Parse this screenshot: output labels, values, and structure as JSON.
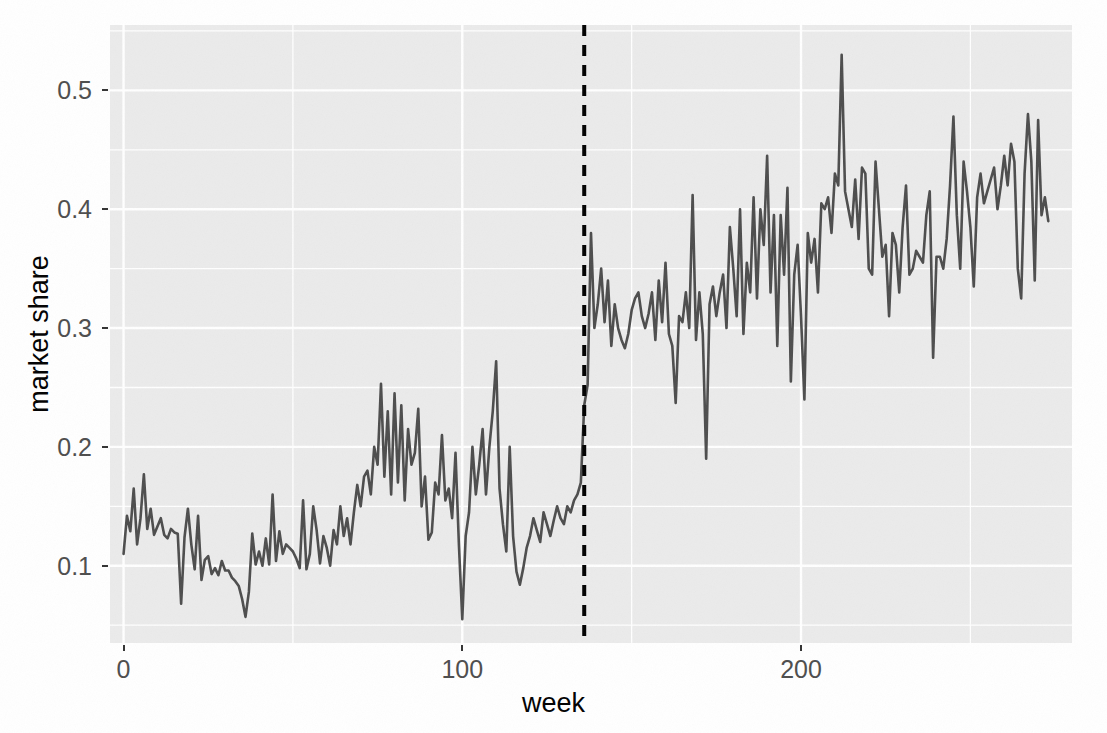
{
  "chart_data": {
    "type": "line",
    "title": "",
    "subtitle": "",
    "xlabel": "week",
    "ylabel": "market share",
    "xlim": [
      -4,
      280
    ],
    "ylim": [
      0.035,
      0.555
    ],
    "grid": true,
    "grid_major": true,
    "grid_minor": true,
    "legend": "none",
    "line_color": "#4d4d4d",
    "panel_color": "#ebebeb",
    "grid_color": "#ffffff",
    "xticks": [
      0,
      100,
      200
    ],
    "xtick_labels": [
      "0",
      "100",
      "200"
    ],
    "yticks": [
      0.1,
      0.2,
      0.3,
      0.4,
      0.5
    ],
    "ytick_labels": [
      "0.1",
      "0.2",
      "0.3",
      "0.4",
      "0.5"
    ],
    "annotations": [
      {
        "name": "intervention-line",
        "type": "vline",
        "x": 136,
        "style": "dashed",
        "color": "#000000",
        "linewidth": 3
      }
    ],
    "series": [
      {
        "name": "market share",
        "x_start": 0,
        "x_step": 1,
        "values": [
          0.11,
          0.142,
          0.129,
          0.165,
          0.118,
          0.14,
          0.177,
          0.131,
          0.148,
          0.126,
          0.133,
          0.14,
          0.126,
          0.123,
          0.131,
          0.128,
          0.127,
          0.068,
          0.124,
          0.148,
          0.118,
          0.097,
          0.142,
          0.088,
          0.105,
          0.108,
          0.093,
          0.098,
          0.092,
          0.104,
          0.096,
          0.096,
          0.09,
          0.087,
          0.083,
          0.072,
          0.057,
          0.078,
          0.127,
          0.101,
          0.112,
          0.1,
          0.123,
          0.101,
          0.16,
          0.104,
          0.129,
          0.11,
          0.118,
          0.115,
          0.112,
          0.106,
          0.098,
          0.155,
          0.097,
          0.11,
          0.15,
          0.13,
          0.102,
          0.125,
          0.115,
          0.1,
          0.13,
          0.118,
          0.15,
          0.125,
          0.14,
          0.118,
          0.145,
          0.168,
          0.15,
          0.175,
          0.18,
          0.16,
          0.2,
          0.185,
          0.253,
          0.175,
          0.23,
          0.16,
          0.245,
          0.17,
          0.235,
          0.155,
          0.215,
          0.185,
          0.195,
          0.232,
          0.15,
          0.175,
          0.122,
          0.128,
          0.17,
          0.16,
          0.21,
          0.155,
          0.165,
          0.14,
          0.195,
          0.118,
          0.055,
          0.125,
          0.145,
          0.2,
          0.16,
          0.185,
          0.215,
          0.16,
          0.2,
          0.23,
          0.272,
          0.165,
          0.135,
          0.112,
          0.2,
          0.125,
          0.095,
          0.084,
          0.098,
          0.115,
          0.125,
          0.14,
          0.13,
          0.12,
          0.145,
          0.135,
          0.125,
          0.138,
          0.15,
          0.14,
          0.135,
          0.15,
          0.145,
          0.155,
          0.16,
          0.17,
          0.235,
          0.252,
          0.38,
          0.3,
          0.32,
          0.35,
          0.305,
          0.34,
          0.285,
          0.32,
          0.3,
          0.29,
          0.283,
          0.295,
          0.315,
          0.325,
          0.33,
          0.31,
          0.3,
          0.312,
          0.33,
          0.29,
          0.34,
          0.305,
          0.355,
          0.295,
          0.285,
          0.237,
          0.31,
          0.305,
          0.33,
          0.3,
          0.412,
          0.29,
          0.33,
          0.295,
          0.19,
          0.32,
          0.335,
          0.31,
          0.33,
          0.345,
          0.3,
          0.385,
          0.35,
          0.31,
          0.4,
          0.295,
          0.355,
          0.33,
          0.41,
          0.325,
          0.4,
          0.37,
          0.445,
          0.33,
          0.395,
          0.285,
          0.395,
          0.345,
          0.418,
          0.255,
          0.345,
          0.37,
          0.31,
          0.24,
          0.38,
          0.355,
          0.375,
          0.33,
          0.405,
          0.4,
          0.41,
          0.38,
          0.43,
          0.42,
          0.53,
          0.415,
          0.4,
          0.385,
          0.425,
          0.375,
          0.435,
          0.43,
          0.35,
          0.345,
          0.44,
          0.4,
          0.36,
          0.37,
          0.31,
          0.38,
          0.37,
          0.33,
          0.385,
          0.42,
          0.345,
          0.35,
          0.365,
          0.36,
          0.355,
          0.395,
          0.415,
          0.275,
          0.36,
          0.36,
          0.35,
          0.375,
          0.42,
          0.478,
          0.395,
          0.35,
          0.44,
          0.415,
          0.385,
          0.335,
          0.41,
          0.43,
          0.405,
          0.415,
          0.425,
          0.435,
          0.4,
          0.42,
          0.445,
          0.42,
          0.455,
          0.44,
          0.35,
          0.325,
          0.43,
          0.48,
          0.44,
          0.34,
          0.475,
          0.395,
          0.41,
          0.39
        ]
      }
    ]
  },
  "axes": {
    "x_title": "week",
    "y_title": "market share"
  }
}
